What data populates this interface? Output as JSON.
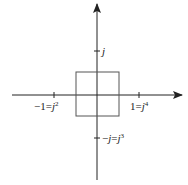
{
  "diagram": {
    "colors": {
      "axis": "#222222",
      "square": "#555555",
      "background": "#ffffff"
    },
    "axes": {
      "origin": {
        "x": 97,
        "y": 95
      },
      "horizontal": {
        "x_start": 12,
        "x_end": 182,
        "arrow": "right"
      },
      "vertical": {
        "y_start": 4,
        "y_end": 180,
        "arrow": "up"
      }
    },
    "square": {
      "x": 76,
      "y": 72,
      "width": 43,
      "height": 44
    },
    "ticks": [
      {
        "name": "j",
        "x": 97,
        "y": 51,
        "orientation": "vertical-axis"
      },
      {
        "name": "neg-1",
        "x": 54,
        "y": 95,
        "orientation": "horizontal-axis"
      },
      {
        "name": "pos-1",
        "x": 139,
        "y": 95,
        "orientation": "horizontal-axis"
      },
      {
        "name": "neg-j",
        "x": 97,
        "y": 138,
        "orientation": "vertical-axis"
      }
    ],
    "labels": {
      "j": {
        "text": "j"
      },
      "neg_one": {
        "base": "−1=",
        "var": "j",
        "exp": "2"
      },
      "pos_one": {
        "base": "1=",
        "var": "j",
        "exp": "4"
      },
      "neg_j": {
        "base": "−",
        "var1": "j",
        "eq": "=",
        "var2": "j",
        "exp": "3"
      }
    }
  }
}
